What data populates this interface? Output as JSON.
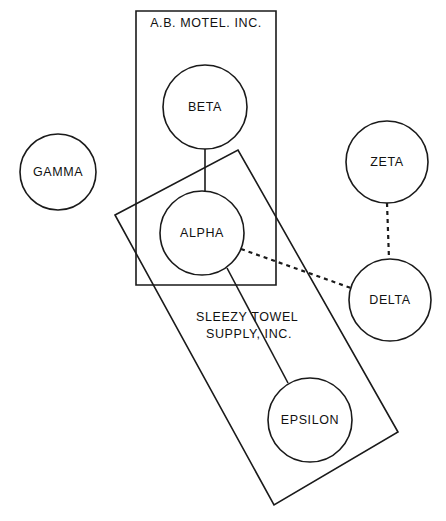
{
  "diagram": {
    "canvas": {
      "width": 446,
      "height": 521,
      "background": "#ffffff"
    },
    "stroke_color": "#1a1a1a",
    "nodes": [
      {
        "id": "gamma",
        "label": "GAMMA",
        "cx": 58,
        "cy": 172,
        "r": 38
      },
      {
        "id": "beta",
        "label": "BETA",
        "cx": 205,
        "cy": 107,
        "r": 42
      },
      {
        "id": "alpha",
        "label": "ALPHA",
        "cx": 202,
        "cy": 233,
        "r": 42
      },
      {
        "id": "zeta",
        "label": "ZETA",
        "cx": 387,
        "cy": 162,
        "r": 41
      },
      {
        "id": "delta",
        "label": "DELTA",
        "cx": 390,
        "cy": 300,
        "r": 41
      },
      {
        "id": "epsilon",
        "label": "EPSILON",
        "cx": 310,
        "cy": 420,
        "r": 42
      }
    ],
    "edges": [
      {
        "id": "beta-alpha",
        "from": "BETA",
        "to": "ALPHA",
        "style": "solid",
        "path": "M 205 149 L 205 191"
      },
      {
        "id": "alpha-epsilon",
        "from": "ALPHA",
        "to": "EPSILON",
        "style": "solid",
        "path": "M 227 268 L 288 383"
      },
      {
        "id": "alpha-delta",
        "from": "ALPHA",
        "to": "DELTA",
        "style": "dashed",
        "path": "M 241 249 L 351 288"
      },
      {
        "id": "zeta-delta",
        "from": "ZETA",
        "to": "DELTA",
        "style": "dashed",
        "path": "M 387 203 L 389 259"
      }
    ],
    "boundaries": [
      {
        "id": "ab-motel",
        "label": "A.B. MOTEL. INC.",
        "shape": "rect",
        "path": "M 136 11 L 276 11 L 276 285 L 136 285 Z",
        "label_lines": [
          "A.B. MOTEL. INC."
        ],
        "label_x": 206,
        "label_y": 27
      },
      {
        "id": "sleezy-towel",
        "label": "SLEEZY TOWEL SUPPLY, INC.",
        "shape": "tilted-rect",
        "path": "M 115 215 L 238 150 L 398 432 L 274 505 Z",
        "label_lines": [
          "SLEEZY   TOWEL",
          "SUPPLY,   INC."
        ],
        "label_x": 249,
        "label_y": 321
      }
    ]
  }
}
